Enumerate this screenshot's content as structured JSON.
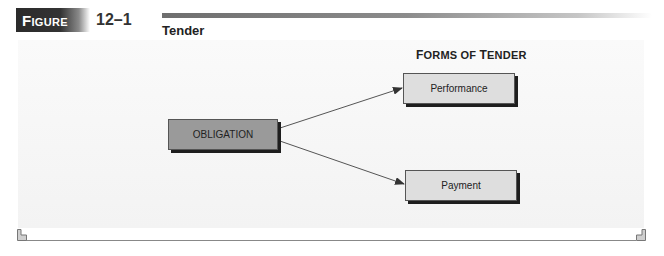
{
  "figure": {
    "label_prefix": "F",
    "label_rest": "IGURE",
    "number": "12–1",
    "title": "Tender"
  },
  "diagram": {
    "column_heading": {
      "first": "F",
      "rest1": "ORMS OF ",
      "second": "T",
      "rest2": "ENDER"
    },
    "source_node": {
      "label": "OBLIGATION",
      "fill": "#9a9a9a"
    },
    "target_nodes": [
      {
        "label": "Performance",
        "fill": "#dedede"
      },
      {
        "label": "Payment",
        "fill": "#dedede"
      }
    ],
    "edges": [
      {
        "from": "OBLIGATION",
        "to": "Performance"
      },
      {
        "from": "OBLIGATION",
        "to": "Payment"
      }
    ]
  }
}
